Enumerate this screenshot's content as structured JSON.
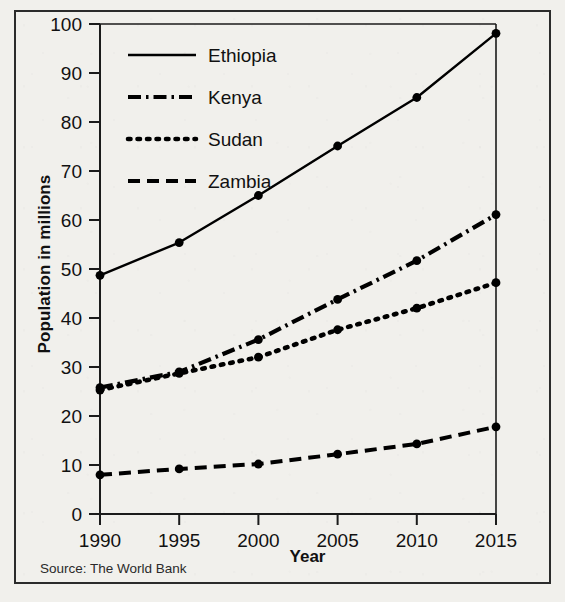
{
  "figure": {
    "source_note": "Source: The World Bank"
  },
  "chart_data": {
    "type": "line",
    "title": "",
    "xlabel": "Year",
    "ylabel": "Population in millions",
    "x": [
      1990,
      1995,
      2000,
      2005,
      2010,
      2015
    ],
    "xticklabels": [
      "1990",
      "1995",
      "2000",
      "2005",
      "2010",
      "2015"
    ],
    "yticks": [
      0,
      10,
      20,
      30,
      40,
      50,
      60,
      70,
      80,
      90,
      100
    ],
    "yticklabels": [
      "0",
      "10",
      "20",
      "30",
      "40",
      "50",
      "60",
      "70",
      "80",
      "90",
      "100"
    ],
    "xlim": [
      1990,
      2015
    ],
    "ylim": [
      0,
      100
    ],
    "grid": false,
    "legend_position": "upper-left-inside",
    "marker": "filled-circle",
    "line_color": "#000000",
    "series": [
      {
        "name": "Ethiopia",
        "dash": "solid",
        "values": [
          48.7,
          55.4,
          65.0,
          75.1,
          85.0,
          98.1
        ]
      },
      {
        "name": "Kenya",
        "dash": "dash-dot",
        "values": [
          25.8,
          29.0,
          35.6,
          43.8,
          51.7,
          61.1
        ]
      },
      {
        "name": "Sudan",
        "dash": "dotted",
        "values": [
          25.3,
          28.7,
          32.0,
          37.6,
          42.0,
          47.2
        ]
      },
      {
        "name": "Zambia",
        "dash": "dashed",
        "values": [
          8.0,
          9.2,
          10.2,
          12.2,
          14.3,
          17.8
        ]
      }
    ]
  }
}
